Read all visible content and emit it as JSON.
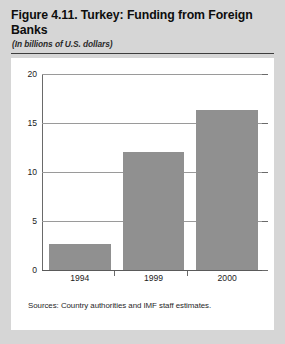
{
  "figure": {
    "title": "Figure 4.11. Turkey: Funding from Foreign Banks",
    "subtitle": "(In billions of U.S. dollars)",
    "source": "Sources: Country authorities and IMF staff estimates."
  },
  "colors": {
    "bar_fill": "#909090",
    "page_background": "#d6d6d6",
    "panel_background": "#ffffff",
    "gridline": "#9a9a9a",
    "axis": "#5a5a5a"
  },
  "chart_data": {
    "type": "bar",
    "title": "Figure 4.11. Turkey: Funding from Foreign Banks",
    "subtitle": "(In billions of U.S. dollars)",
    "categories": [
      "1994",
      "1999",
      "2000"
    ],
    "values": [
      2.7,
      12.0,
      16.3
    ],
    "series": [
      {
        "name": "Funding from Foreign Banks",
        "values": [
          2.7,
          12.0,
          16.3
        ]
      }
    ],
    "xlabel": "",
    "ylabel": "",
    "ylim": [
      0,
      20
    ],
    "yticks": [
      0,
      5,
      10,
      15,
      20
    ],
    "ytick_labels": [
      "0",
      "5",
      "10",
      "15",
      "20"
    ],
    "grid": true,
    "legend": false,
    "annotations": [
      "Sources: Country authorities and IMF staff estimates."
    ]
  }
}
